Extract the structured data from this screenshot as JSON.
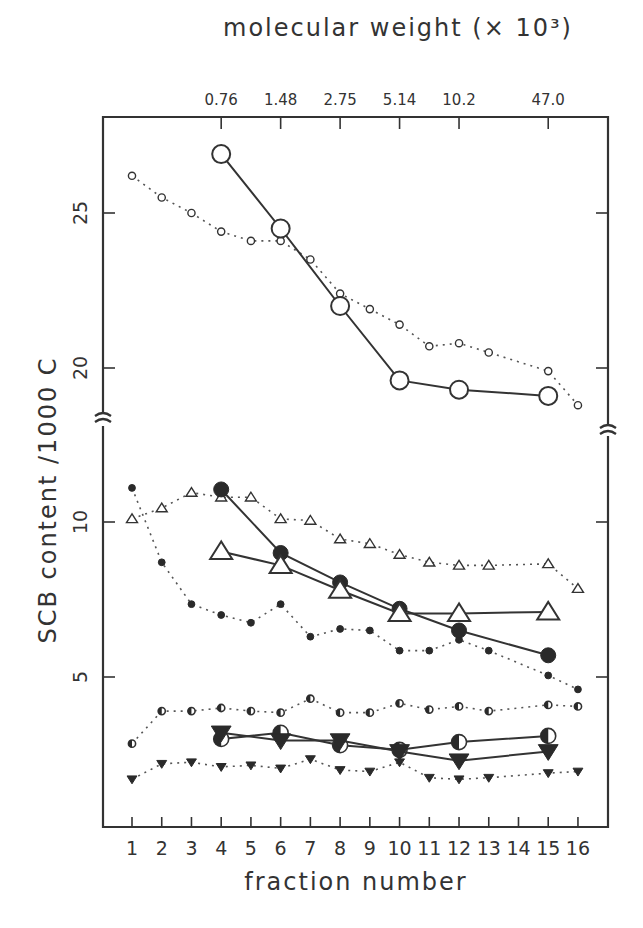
{
  "chart_data": {
    "type": "line",
    "title": "",
    "xlabel": "fraction number",
    "ylabel": "SCB content  /1000 C",
    "top_axis_label": "molecular weight (× 10³)",
    "top_axis_ticks": [
      {
        "fraction": 4,
        "label": "0.76"
      },
      {
        "fraction": 6,
        "label": "1.48"
      },
      {
        "fraction": 8,
        "label": "2.75"
      },
      {
        "fraction": 10,
        "label": "5.14"
      },
      {
        "fraction": 12,
        "label": "10.2"
      },
      {
        "fraction": 15,
        "label": "47.0"
      }
    ],
    "x_ticks": [
      "1",
      "2",
      "3",
      "4",
      "5",
      "6",
      "7",
      "8",
      "9",
      "10",
      "11",
      "12",
      "13",
      "14",
      "15",
      "16"
    ],
    "y_ticks_lower": [
      "5",
      "10"
    ],
    "y_ticks_upper": [
      "20",
      "25"
    ],
    "ylim_lower": [
      0,
      12.5
    ],
    "ylim_upper": [
      18,
      28
    ],
    "axis_break": "between 12.5 and 18",
    "grid": false,
    "legend": "none",
    "series": [
      {
        "name": "open-circle-large",
        "style": "solid",
        "marker": "open-circle-large",
        "x": [
          4,
          6,
          8,
          10,
          12,
          15
        ],
        "y": [
          26.9,
          24.5,
          22.0,
          19.6,
          19.3,
          19.1
        ]
      },
      {
        "name": "open-circle-small",
        "style": "dotted",
        "marker": "open-circle-small",
        "x": [
          1,
          2,
          3,
          4,
          5,
          6,
          7,
          8,
          9,
          10,
          11,
          12,
          13,
          15,
          16
        ],
        "y": [
          26.2,
          25.5,
          25.0,
          24.4,
          24.1,
          24.1,
          23.5,
          22.4,
          21.9,
          21.4,
          20.7,
          20.8,
          20.5,
          19.9,
          18.8
        ]
      },
      {
        "name": "filled-circle-large",
        "style": "solid",
        "marker": "filled-circle-large",
        "x": [
          4,
          6,
          8,
          10,
          12,
          15
        ],
        "y": [
          11.05,
          9.0,
          8.05,
          7.2,
          6.5,
          5.7
        ]
      },
      {
        "name": "filled-circle-small",
        "style": "dotted",
        "marker": "filled-circle-small",
        "x": [
          1,
          2,
          3,
          4,
          5,
          6,
          7,
          8,
          9,
          10,
          11,
          12,
          13,
          15,
          16
        ],
        "y": [
          11.1,
          8.7,
          7.35,
          7.0,
          6.75,
          7.35,
          6.3,
          6.55,
          6.5,
          5.85,
          5.85,
          6.2,
          5.85,
          5.05,
          4.6
        ]
      },
      {
        "name": "open-triangle-large",
        "style": "solid",
        "marker": "open-triangle-large",
        "x": [
          4,
          6,
          8,
          10,
          12,
          15
        ],
        "y": [
          9.05,
          8.6,
          7.8,
          7.05,
          7.05,
          7.1
        ]
      },
      {
        "name": "open-triangle-small",
        "style": "dotted",
        "marker": "open-triangle-small",
        "x": [
          1,
          2,
          3,
          4,
          5,
          6,
          7,
          8,
          9,
          10,
          11,
          12,
          13,
          15,
          16
        ],
        "y": [
          10.1,
          10.45,
          10.95,
          10.8,
          10.8,
          10.1,
          10.05,
          9.45,
          9.3,
          8.95,
          8.7,
          8.6,
          8.6,
          8.65,
          7.85
        ]
      },
      {
        "name": "half-circle-large",
        "style": "solid",
        "marker": "half-circle-large",
        "x": [
          4,
          6,
          8,
          10,
          12,
          15
        ],
        "y": [
          3.0,
          3.2,
          2.8,
          2.65,
          2.9,
          3.1
        ]
      },
      {
        "name": "half-circle-small",
        "style": "dotted",
        "marker": "half-circle-small",
        "x": [
          1,
          2,
          3,
          4,
          5,
          6,
          7,
          8,
          9,
          10,
          11,
          12,
          13,
          15,
          16
        ],
        "y": [
          2.85,
          3.9,
          3.9,
          4.0,
          3.9,
          3.85,
          4.3,
          3.85,
          3.85,
          4.15,
          3.95,
          4.05,
          3.9,
          4.1,
          4.05
        ]
      },
      {
        "name": "filled-down-triangle-large",
        "style": "solid",
        "marker": "filled-down-triangle-large",
        "x": [
          4,
          6,
          8,
          10,
          12,
          15
        ],
        "y": [
          3.2,
          2.95,
          2.95,
          2.6,
          2.3,
          2.6
        ]
      },
      {
        "name": "filled-down-triangle-small",
        "style": "dotted",
        "marker": "filled-down-triangle-small",
        "x": [
          1,
          2,
          3,
          4,
          5,
          6,
          7,
          8,
          9,
          10,
          11,
          12,
          13,
          15,
          16
        ],
        "y": [
          1.7,
          2.2,
          2.25,
          2.1,
          2.15,
          2.05,
          2.35,
          2.0,
          1.95,
          2.25,
          1.75,
          1.7,
          1.75,
          1.9,
          1.95
        ]
      }
    ]
  }
}
